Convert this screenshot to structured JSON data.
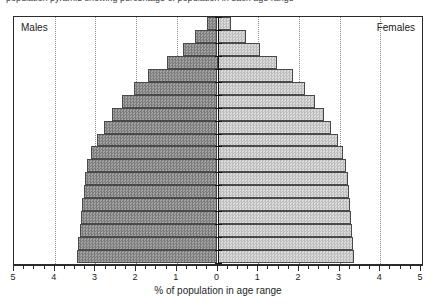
{
  "figure": {
    "clipped_caption": "population pyramid showing percentage of population in each age range",
    "x_axis_title": "% of population in age range",
    "left_label": "Males",
    "right_label": "Females",
    "colors": {
      "male_fill": "#8e8e8e",
      "female_fill": "#c9c9c9",
      "axis": "#2b2b2b",
      "gridline": "#8d8d8d",
      "background": "#ffffff"
    }
  },
  "chart_data": {
    "type": "bar",
    "subtype": "population-pyramid",
    "title": "",
    "xlabel": "% of population in age range",
    "ylabel": "",
    "xlim": [
      -5,
      5
    ],
    "x_tick_labels": [
      "5",
      "4",
      "3",
      "2",
      "1",
      "0",
      "1",
      "2",
      "3",
      "4",
      "5"
    ],
    "x_tick_values": [
      -5,
      -4,
      -3,
      -2,
      -1,
      0,
      1,
      2,
      3,
      4,
      5
    ],
    "x_minor_tick_step": 0.25,
    "gridlines_at": [
      -4,
      -3,
      -2,
      -1,
      1,
      2,
      3,
      4
    ],
    "grid": true,
    "legend_position": "inside-corners",
    "series": [
      {
        "name": "Males",
        "values": [
          0.25,
          0.55,
          0.85,
          1.25,
          1.7,
          2.05,
          2.35,
          2.6,
          2.8,
          2.95,
          3.1,
          3.2,
          3.25,
          3.28,
          3.32,
          3.36,
          3.38,
          3.42,
          3.45
        ]
      },
      {
        "name": "Females",
        "values": [
          0.32,
          0.7,
          1.05,
          1.45,
          1.85,
          2.15,
          2.4,
          2.62,
          2.8,
          2.95,
          3.08,
          3.15,
          3.2,
          3.22,
          3.26,
          3.28,
          3.3,
          3.32,
          3.35
        ]
      }
    ],
    "categories": [
      "band-1",
      "band-2",
      "band-3",
      "band-4",
      "band-5",
      "band-6",
      "band-7",
      "band-8",
      "band-9",
      "band-10",
      "band-11",
      "band-12",
      "band-13",
      "band-14",
      "band-15",
      "band-16",
      "band-17",
      "band-18",
      "band-19"
    ],
    "n_age_bands": 19,
    "band_order": "oldest-at-top"
  }
}
